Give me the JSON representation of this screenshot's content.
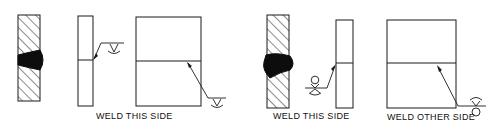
{
  "diagram": {
    "type": "weld-symbol-illustration",
    "colors": {
      "stroke": "#1a1a1a",
      "fill_weld": "#0d0d0d",
      "background": "#ffffff"
    },
    "figures": [
      {
        "id": "fig-a",
        "description": "Cross-section with weld bead on arrow side, narrow plate with arrow-side fillet symbol, plan view with arrow-side symbol",
        "caption": "WELD THIS SIDE",
        "symbol_side": "arrow side"
      },
      {
        "id": "fig-b-left",
        "description": "Cross-section with weld bead, narrow plate with weld-all-around style symbol",
        "caption": "WELD THIS SIDE",
        "symbol_side": "arrow side"
      },
      {
        "id": "fig-b-right",
        "description": "Plan view with other-side symbol",
        "caption": "WELD OTHER SIDE",
        "symbol_side": "other side"
      }
    ]
  }
}
